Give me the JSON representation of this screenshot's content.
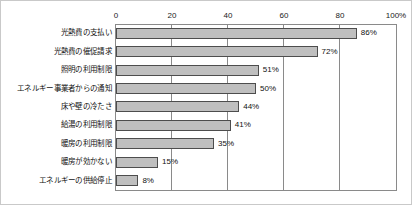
{
  "chart_data": {
    "type": "bar",
    "orientation": "horizontal",
    "title": "",
    "subtitle": "",
    "xlabel": "",
    "ylabel": "",
    "xlim": [
      0,
      100
    ],
    "grid": true,
    "legend": null,
    "unit_suffix": "%",
    "xticks": [
      {
        "value": 0,
        "label": "0"
      },
      {
        "value": 20,
        "label": "20"
      },
      {
        "value": 40,
        "label": "40"
      },
      {
        "value": 60,
        "label": "60"
      },
      {
        "value": 80,
        "label": "80"
      },
      {
        "value": 100,
        "label": "100%"
      }
    ],
    "categories": [
      "光熱費の支払い",
      "光熱費の催促請求",
      "照明の利用制限",
      "エネルギー事業者からの通知",
      "床や壁の冷たさ",
      "給湯の利用制限",
      "暖房の利用制限",
      "暖房が効かない",
      "エネルギーの供給停止"
    ],
    "values": [
      86,
      72,
      51,
      50,
      44,
      41,
      35,
      15,
      8
    ],
    "data_labels": [
      "86%",
      "72%",
      "51%",
      "50%",
      "44%",
      "41%",
      "35%",
      "15%",
      "8%"
    ],
    "bar_fill_color": "#bfbfbf",
    "bar_border_color": "#4d4d4d",
    "plot_border_color": "#8a8a8a",
    "frame_border_color": "#c9c9c9",
    "background_color": "#ffffff",
    "text_color": "#111111"
  }
}
